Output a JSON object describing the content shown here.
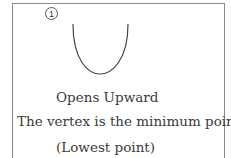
{
  "label": {
    "number": "1"
  },
  "curve": {
    "shape": "parabola-opens-upward",
    "stroke": "#444444"
  },
  "text": {
    "line1": "Opens Upward",
    "line2": "The vertex is the minimum point.",
    "line3": "(Lowest point)"
  }
}
